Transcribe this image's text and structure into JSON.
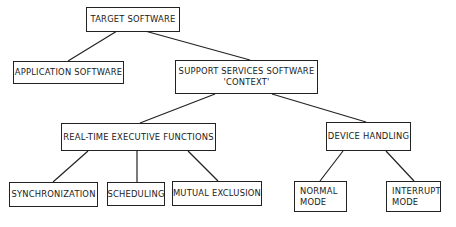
{
  "diagram": {
    "type": "hierarchy-tree",
    "nodes": {
      "target_software": {
        "label": "TARGET SOFTWARE"
      },
      "application_software": {
        "label": "APPLICATION SOFTWARE"
      },
      "support_services": {
        "line1": "SUPPORT SERVICES SOFTWARE",
        "line2": "'CONTEXT'"
      },
      "real_time_executive": {
        "label": "REAL-TIME EXECUTIVE FUNCTIONS"
      },
      "device_handling": {
        "label": "DEVICE HANDLING"
      },
      "synchronization": {
        "label": "SYNCHRONIZATION"
      },
      "scheduling": {
        "label": "SCHEDULING"
      },
      "mutual_exclusion": {
        "label": "MUTUAL EXCLUSION"
      },
      "normal_mode": {
        "line1": "NORMAL",
        "line2": "MODE"
      },
      "interrupt_mode": {
        "line1": "INTERRUPT",
        "line2": "MODE"
      }
    },
    "edges": [
      [
        "target_software",
        "application_software"
      ],
      [
        "target_software",
        "support_services"
      ],
      [
        "support_services",
        "real_time_executive"
      ],
      [
        "support_services",
        "device_handling"
      ],
      [
        "real_time_executive",
        "synchronization"
      ],
      [
        "real_time_executive",
        "scheduling"
      ],
      [
        "real_time_executive",
        "mutual_exclusion"
      ],
      [
        "device_handling",
        "normal_mode"
      ],
      [
        "device_handling",
        "interrupt_mode"
      ]
    ]
  }
}
